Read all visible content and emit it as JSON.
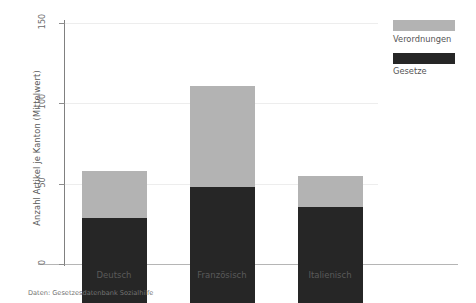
{
  "chart_data": {
    "type": "bar",
    "title": "",
    "subtitle": "",
    "xlabel": "",
    "ylabel": "Anzahl Artikel je Kanton (Mittelwert)",
    "categories": [
      "Deutsch",
      "Französisch",
      "Italienisch"
    ],
    "series": [
      {
        "name": "Gesetze",
        "values": [
          53,
          72,
          60
        ],
        "color": "#262626"
      },
      {
        "name": "Verordnungen",
        "values": [
          29,
          63,
          19
        ],
        "color": "#b3b3b3"
      }
    ],
    "totals": [
      82,
      135,
      79
    ],
    "stacked": true,
    "ylim": [
      0,
      150
    ],
    "yticks": [
      0,
      50,
      100,
      150
    ],
    "ytick_labels": [
      "0",
      "50",
      "100",
      "150"
    ],
    "grid": "horizontal",
    "legend_position": "right-top",
    "annotation": "Daten: Gesetzesdatenbank Sozialhilfe"
  },
  "axis": {
    "y_title": "Anzahl Artikel je Kanton (Mittelwert)",
    "ticks": [
      {
        "label": "150",
        "value": 150
      },
      {
        "label": "100",
        "value": 100
      },
      {
        "label": "50",
        "value": 50
      },
      {
        "label": "0",
        "value": 0
      }
    ],
    "categories": [
      {
        "label": "Deutsch"
      },
      {
        "label": "Französisch"
      },
      {
        "label": "Italienisch"
      }
    ]
  },
  "legend": {
    "items": [
      {
        "label": "Verordnungen",
        "color": "#b3b3b3"
      },
      {
        "label": "Gesetze",
        "color": "#262626"
      }
    ]
  },
  "footer": {
    "source": "Daten: Gesetzesdatenbank Sozialhilfe"
  }
}
